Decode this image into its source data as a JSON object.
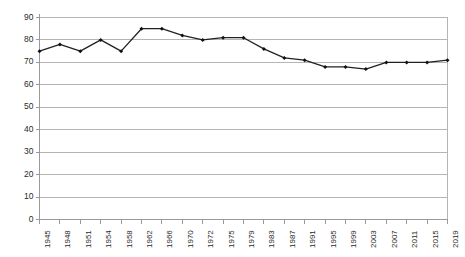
{
  "chart_data": {
    "type": "line",
    "title": "",
    "xlabel": "",
    "ylabel": "",
    "ylim": [
      0,
      90
    ],
    "ytick_step": 10,
    "grid": true,
    "grid_axis": "y",
    "legend": false,
    "line_color": "#222222",
    "marker_color": "#111111",
    "marker": "diamond",
    "axis_color": "#9a9a9a",
    "grid_color": "#b5b5b5",
    "categories": [
      "1945",
      "1948",
      "1951",
      "1954",
      "1958",
      "1962",
      "1966",
      "1970",
      "1972",
      "1975",
      "1979",
      "1983",
      "1987",
      "1991",
      "1995",
      "1999",
      "2003",
      "2007",
      "2011",
      "2015",
      "2019"
    ],
    "values": [
      75,
      78,
      75,
      80,
      75,
      85,
      85,
      82,
      80,
      81,
      81,
      76,
      72,
      71,
      68,
      68,
      67,
      70,
      70,
      70,
      71
    ],
    "yticks": [
      "0",
      "10",
      "20",
      "30",
      "40",
      "50",
      "60",
      "70",
      "80",
      "90"
    ]
  }
}
